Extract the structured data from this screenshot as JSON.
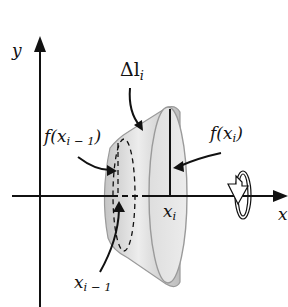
{
  "diagram": {
    "axes": {
      "x_label": "x",
      "y_label": "y"
    },
    "labels": {
      "delta_l": {
        "main": "Δl",
        "sub": "i"
      },
      "f_prev": {
        "main": "f(x",
        "sub": "i − 1",
        "close": ")"
      },
      "f_curr": {
        "main": "f(x",
        "sub": "i",
        "close": ")"
      },
      "x_curr": {
        "main": "x",
        "sub": "i"
      },
      "x_prev": {
        "main": "x",
        "sub": "i − 1"
      }
    },
    "colors": {
      "axis": "#111111",
      "surface_light": "#e6e6e6",
      "surface_dark": "#b3b3b3",
      "outline": "#9a9a9a"
    },
    "icons": {
      "rotation": "rotation-arrow-icon"
    }
  }
}
